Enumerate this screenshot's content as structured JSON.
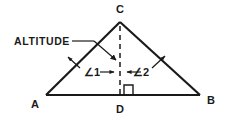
{
  "figure": {
    "background_color": "#ffffff",
    "ink_color": "#1a1a1a",
    "width": 226,
    "height": 118
  },
  "labels": {
    "vertex_a": "A",
    "vertex_b": "B",
    "vertex_c": "C",
    "vertex_d": "D",
    "angle_1": "∠1",
    "angle_2": "∠2",
    "callout_altitude": "ALTITUDE"
  },
  "geometry": {
    "points": {
      "A": [
        46,
        95
      ],
      "B": [
        200,
        95
      ],
      "C": [
        120,
        22
      ],
      "D": [
        120,
        95
      ]
    },
    "altitude_segment": {
      "from": "C",
      "to": "D",
      "style": "dashed"
    },
    "right_angle_marker": {
      "at": "D",
      "size": 9,
      "side": "right"
    },
    "sides": [
      {
        "name": "AB",
        "from": "A",
        "to": "B",
        "style": "solid"
      },
      {
        "name": "AC",
        "from": "A",
        "to": "C",
        "style": "solid"
      },
      {
        "name": "CB",
        "from": "C",
        "to": "B",
        "style": "solid"
      }
    ]
  },
  "annotations": {
    "altitude_leader": {
      "label": "ALTITUDE",
      "text_anchor": [
        14,
        45
      ],
      "leader_start": [
        72,
        41
      ],
      "leader_end": [
        94,
        41
      ],
      "arrow_from": [
        94,
        41
      ],
      "arrow_to": [
        118,
        61
      ]
    },
    "angle_1_pointer": {
      "label": "∠1",
      "text_anchor": [
        84,
        74
      ],
      "arrow_from": [
        78,
        66
      ],
      "arrow_to": [
        67,
        56
      ]
    },
    "angle_1_tick": {
      "arrow_from": [
        96,
        72
      ],
      "arrow_to": [
        115,
        72
      ]
    },
    "angle_2_pointer": {
      "label": "∠2",
      "text_anchor": [
        135,
        74
      ],
      "arrow_from": [
        152,
        68
      ],
      "arrow_to": [
        166,
        55
      ]
    },
    "angle_2_tick": {
      "arrow_from": [
        144,
        72
      ],
      "arrow_to": [
        126,
        72
      ]
    }
  }
}
